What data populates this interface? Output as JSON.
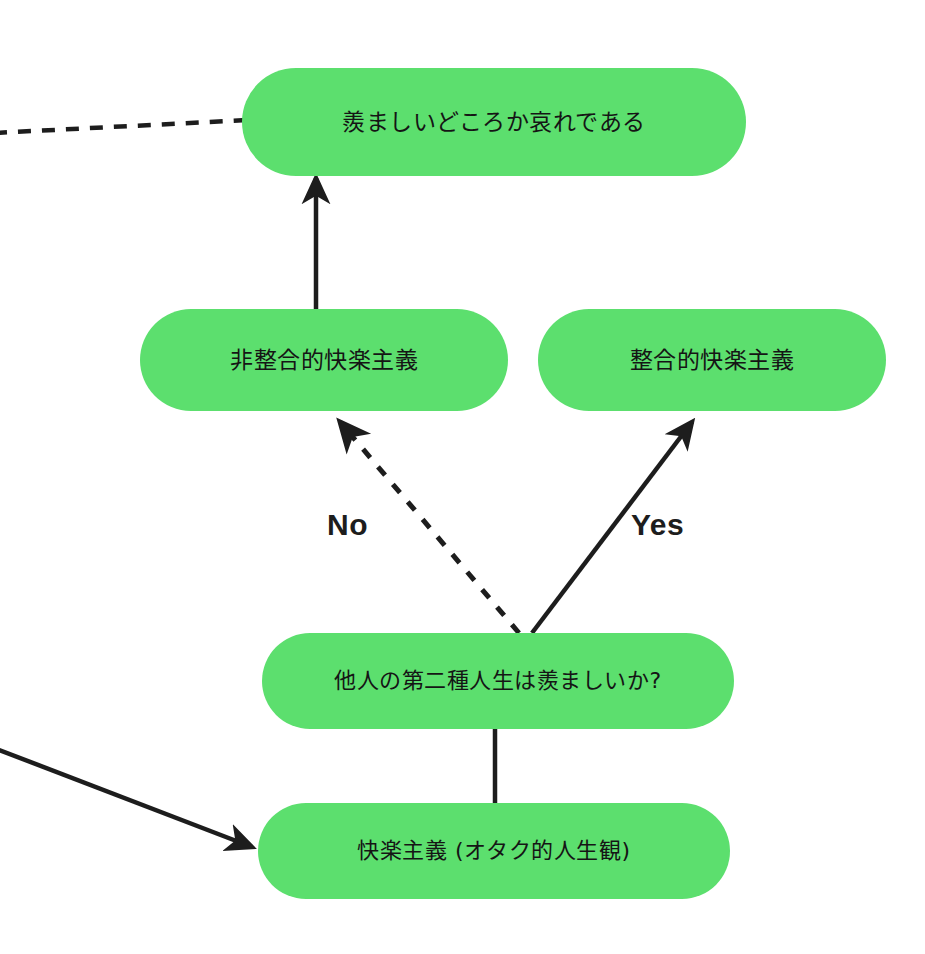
{
  "diagram": {
    "background_color": "#ffffff",
    "node_fill_color": "#5cdf6e",
    "edge_color": "#1d1d1d",
    "nodes": [
      {
        "id": "conclusion",
        "label": "羨ましいどころか哀れである"
      },
      {
        "id": "nonintegrated",
        "label": "非整合的快楽主義"
      },
      {
        "id": "integrated",
        "label": "整合的快楽主義"
      },
      {
        "id": "question",
        "label": "他人の第二種人生は羨ましいか?"
      },
      {
        "id": "hedonism",
        "label": "快楽主義 (オタク的人生観)"
      }
    ],
    "edge_labels": {
      "no": "No",
      "yes": "Yes"
    },
    "edges": [
      {
        "id": "edge-nonintegrated-to-conclusion",
        "from": "nonintegrated",
        "to": "conclusion",
        "style": "solid",
        "arrow": true
      },
      {
        "id": "edge-question-to-nonintegrated",
        "from": "question",
        "to": "nonintegrated",
        "style": "dashed",
        "arrow": true,
        "label": "No"
      },
      {
        "id": "edge-question-to-integrated",
        "from": "question",
        "to": "integrated",
        "style": "solid",
        "arrow": true,
        "label": "Yes"
      },
      {
        "id": "edge-hedonism-to-question",
        "from": "hedonism",
        "to": "question",
        "style": "solid",
        "arrow": false
      },
      {
        "id": "edge-offscreen-to-conclusion",
        "from": "offscreen-left",
        "to": "conclusion",
        "style": "dashed",
        "arrow": false
      },
      {
        "id": "edge-offscreen-to-hedonism",
        "from": "offscreen-left",
        "to": "hedonism",
        "style": "solid",
        "arrow": true
      }
    ]
  }
}
